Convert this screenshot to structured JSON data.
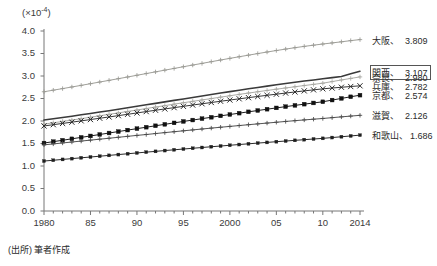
{
  "figure": {
    "unit_label_prefix": "(×10",
    "unit_label_exp": "-4",
    "unit_label_suffix": ")",
    "source_note": "(出所) 筆者作成"
  },
  "chart_data": {
    "type": "line",
    "title": "",
    "subtitle": "",
    "xlabel": "",
    "ylabel": "(×10^-4)",
    "unit": "×10^-4",
    "grid": false,
    "legend_position": "right",
    "xlim": [
      1980,
      2014
    ],
    "ylim": [
      0.0,
      4.0
    ],
    "ytick_values": [
      0.0,
      0.5,
      1.0,
      1.5,
      2.0,
      2.5,
      3.0,
      3.5,
      4.0
    ],
    "ytick_labels": [
      "0.0",
      "0.5",
      "1.0",
      "1.5",
      "2.0",
      "2.5",
      "3.0",
      "3.5",
      "4.0"
    ],
    "xtick_values": [
      1980,
      1985,
      1990,
      1995,
      2000,
      2005,
      2010,
      2014
    ],
    "xtick_labels": [
      "1980",
      "85",
      "90",
      "95",
      "2000",
      "05",
      "10",
      "2014"
    ],
    "x": [
      1980,
      1981,
      1982,
      1983,
      1984,
      1985,
      1986,
      1987,
      1988,
      1989,
      1990,
      1991,
      1992,
      1993,
      1994,
      1995,
      1996,
      1997,
      1998,
      1999,
      2000,
      2001,
      2002,
      2003,
      2004,
      2005,
      2006,
      2007,
      2008,
      2009,
      2010,
      2011,
      2012,
      2013,
      2014
    ],
    "series": [
      {
        "name": "大阪",
        "end_value": 3.809,
        "color": "#9a9a94",
        "marker": "plus",
        "values": [
          2.65,
          2.685,
          2.72,
          2.756,
          2.792,
          2.829,
          2.866,
          2.903,
          2.94,
          2.978,
          3.016,
          3.054,
          3.092,
          3.13,
          3.168,
          3.206,
          3.243,
          3.28,
          3.318,
          3.355,
          3.392,
          3.428,
          3.463,
          3.498,
          3.533,
          3.566,
          3.598,
          3.629,
          3.658,
          3.685,
          3.711,
          3.735,
          3.76,
          3.786,
          3.809
        ]
      },
      {
        "name": "関西",
        "end_value": 3.107,
        "color": "#3a3a3a",
        "marker": "none",
        "values": [
          2.02,
          2.049,
          2.078,
          2.107,
          2.137,
          2.167,
          2.198,
          2.229,
          2.261,
          2.293,
          2.326,
          2.359,
          2.392,
          2.425,
          2.458,
          2.491,
          2.524,
          2.557,
          2.589,
          2.621,
          2.653,
          2.684,
          2.715,
          2.745,
          2.775,
          2.804,
          2.832,
          2.86,
          2.887,
          2.913,
          2.939,
          2.964,
          2.99,
          3.049,
          3.107
        ]
      },
      {
        "name": "奈良",
        "end_value": 2.98,
        "color": "#a8a8a2",
        "marker": "plus",
        "values": [
          1.93,
          1.96,
          1.99,
          2.021,
          2.052,
          2.084,
          2.116,
          2.148,
          2.18,
          2.212,
          2.244,
          2.277,
          2.31,
          2.342,
          2.374,
          2.406,
          2.437,
          2.468,
          2.499,
          2.53,
          2.561,
          2.591,
          2.621,
          2.65,
          2.679,
          2.707,
          2.734,
          2.761,
          2.788,
          2.814,
          2.84,
          2.876,
          2.912,
          2.946,
          2.98
        ]
      },
      {
        "name": "兵庫",
        "end_value": 2.782,
        "color": "#2b2b2b",
        "marker": "cross",
        "values": [
          1.89,
          1.918,
          1.946,
          1.974,
          2.003,
          2.032,
          2.061,
          2.09,
          2.119,
          2.149,
          2.179,
          2.209,
          2.239,
          2.268,
          2.297,
          2.326,
          2.355,
          2.383,
          2.411,
          2.439,
          2.466,
          2.493,
          2.519,
          2.545,
          2.571,
          2.596,
          2.621,
          2.645,
          2.669,
          2.692,
          2.715,
          2.733,
          2.75,
          2.766,
          2.782
        ]
      },
      {
        "name": "京都",
        "end_value": 2.574,
        "color": "#111111",
        "marker": "square",
        "values": [
          1.51,
          1.541,
          1.572,
          1.604,
          1.636,
          1.668,
          1.7,
          1.733,
          1.765,
          1.798,
          1.83,
          1.862,
          1.894,
          1.926,
          1.958,
          1.99,
          2.021,
          2.052,
          2.083,
          2.114,
          2.144,
          2.174,
          2.204,
          2.233,
          2.262,
          2.291,
          2.319,
          2.347,
          2.374,
          2.401,
          2.427,
          2.465,
          2.502,
          2.538,
          2.574
        ]
      },
      {
        "name": "滋賀",
        "end_value": 2.126,
        "color": "#4a4a4a",
        "marker": "plus",
        "values": [
          1.47,
          1.491,
          1.512,
          1.533,
          1.554,
          1.575,
          1.596,
          1.617,
          1.638,
          1.659,
          1.68,
          1.7,
          1.721,
          1.742,
          1.762,
          1.782,
          1.802,
          1.822,
          1.842,
          1.861,
          1.88,
          1.899,
          1.918,
          1.936,
          1.954,
          1.972,
          1.99,
          2.007,
          2.024,
          2.04,
          2.056,
          2.074,
          2.092,
          2.109,
          2.126
        ]
      },
      {
        "name": "和歌山",
        "end_value": 1.686,
        "color": "#1e1e1e",
        "marker": "dot",
        "values": [
          1.11,
          1.128,
          1.146,
          1.164,
          1.182,
          1.2,
          1.218,
          1.236,
          1.254,
          1.272,
          1.29,
          1.308,
          1.325,
          1.343,
          1.36,
          1.377,
          1.394,
          1.411,
          1.428,
          1.444,
          1.461,
          1.477,
          1.493,
          1.509,
          1.524,
          1.54,
          1.555,
          1.57,
          1.585,
          1.6,
          1.614,
          1.632,
          1.65,
          1.668,
          1.686
        ]
      }
    ]
  },
  "legend": {
    "highlight_index": 1,
    "entries": [
      {
        "name": "大阪",
        "value": "3.809"
      },
      {
        "name": "関西",
        "value": "3.107"
      },
      {
        "name": "奈良",
        "value": "2.980"
      },
      {
        "name": "兵庫",
        "value": "2.782"
      },
      {
        "name": "京都",
        "value": "2.574"
      },
      {
        "name": "滋賀",
        "value": "2.126"
      },
      {
        "name": "和歌山",
        "value": "1.686"
      }
    ]
  }
}
